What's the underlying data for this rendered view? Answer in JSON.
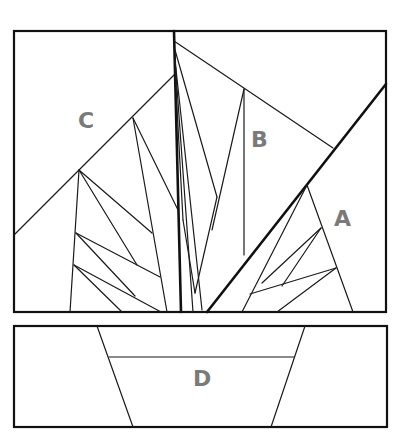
{
  "diagram": {
    "sections": [
      {
        "id": "C",
        "label": "C",
        "x": 87,
        "y": 127
      },
      {
        "id": "B",
        "label": "B",
        "x": 260,
        "y": 145
      },
      {
        "id": "A",
        "label": "A",
        "x": 345,
        "y": 224
      },
      {
        "id": "D",
        "label": "D",
        "x": 203,
        "y": 384
      }
    ],
    "panels": [
      {
        "name": "top-panel",
        "x": 14,
        "y": 31,
        "width": 372,
        "height": 281
      },
      {
        "name": "bottom-panel",
        "x": 14,
        "y": 326,
        "width": 373,
        "height": 101
      }
    ],
    "colors": {
      "line": "#111111",
      "label": "#7a7a7a",
      "background": "#ffffff"
    }
  }
}
